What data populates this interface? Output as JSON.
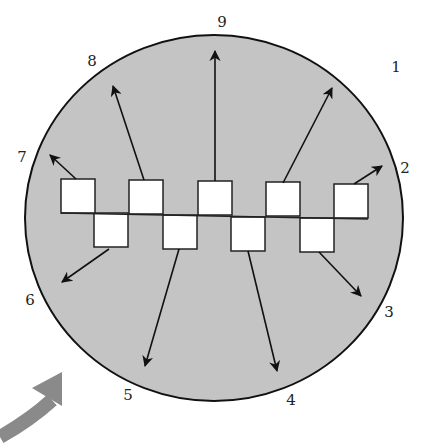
{
  "diagram": {
    "colors": {
      "disk_fill": "#c4c4c4",
      "disk_stroke": "#111111",
      "square_fill": "#ffffff",
      "arrow": "#111111",
      "curved_arrow": "#8a8a8a"
    },
    "labels": [
      {
        "text": "1",
        "x": 396,
        "y": 72
      },
      {
        "text": "2",
        "x": 405,
        "y": 173
      },
      {
        "text": "3",
        "x": 389,
        "y": 317
      },
      {
        "text": "4",
        "x": 291,
        "y": 405
      },
      {
        "text": "5",
        "x": 128,
        "y": 400
      },
      {
        "text": "6",
        "x": 30,
        "y": 305
      },
      {
        "text": "7",
        "x": 22,
        "y": 162
      },
      {
        "text": "8",
        "x": 92,
        "y": 66
      },
      {
        "text": "9",
        "x": 222,
        "y": 27
      }
    ],
    "top_squares": [
      {
        "x": 61,
        "y": 179
      },
      {
        "x": 129,
        "y": 180
      },
      {
        "x": 198,
        "y": 181
      },
      {
        "x": 266,
        "y": 182
      },
      {
        "x": 334,
        "y": 184
      }
    ],
    "bottom_squares": [
      {
        "x": 94,
        "y": 213
      },
      {
        "x": 163,
        "y": 215
      },
      {
        "x": 231,
        "y": 217
      },
      {
        "x": 300,
        "y": 218
      }
    ],
    "arrows": [
      {
        "id": "1",
        "x1": 283,
        "y1": 183,
        "x2": 332,
        "y2": 88
      },
      {
        "id": "2",
        "x1": 354,
        "y1": 184,
        "x2": 382,
        "y2": 166
      },
      {
        "id": "3",
        "x1": 319,
        "y1": 252,
        "x2": 361,
        "y2": 296
      },
      {
        "id": "4",
        "x1": 248,
        "y1": 251,
        "x2": 277,
        "y2": 371
      },
      {
        "id": "5",
        "x1": 179,
        "y1": 249,
        "x2": 145,
        "y2": 366
      },
      {
        "id": "6",
        "x1": 109,
        "y1": 249,
        "x2": 62,
        "y2": 282
      },
      {
        "id": "7",
        "x1": 76,
        "y1": 179,
        "x2": 50,
        "y2": 155
      },
      {
        "id": "8",
        "x1": 144,
        "y1": 180,
        "x2": 113,
        "y2": 86
      },
      {
        "id": "9",
        "x1": 215,
        "y1": 181,
        "x2": 215,
        "y2": 51
      }
    ]
  }
}
